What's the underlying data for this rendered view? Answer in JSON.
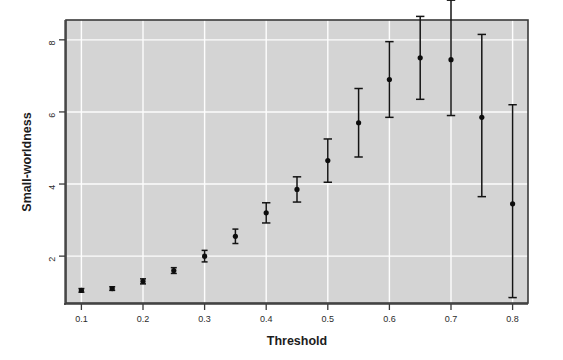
{
  "chart_data": {
    "type": "scatter",
    "title": "",
    "xlabel": "Threshold",
    "ylabel": "Small-worldness",
    "x": [
      0.1,
      0.15,
      0.2,
      0.25,
      0.3,
      0.35,
      0.4,
      0.45,
      0.5,
      0.55,
      0.6,
      0.65,
      0.7,
      0.75,
      0.8
    ],
    "values": [
      1.05,
      1.1,
      1.3,
      1.6,
      2.0,
      2.55,
      3.2,
      3.85,
      4.65,
      5.7,
      6.9,
      7.5,
      7.45,
      5.85,
      3.45
    ],
    "error_low": [
      0.05,
      0.05,
      0.07,
      0.08,
      0.16,
      0.2,
      0.28,
      0.35,
      0.6,
      0.95,
      1.05,
      1.15,
      1.55,
      2.2,
      2.6
    ],
    "error_high": [
      0.05,
      0.05,
      0.07,
      0.08,
      0.16,
      0.2,
      0.28,
      0.35,
      0.6,
      0.95,
      1.05,
      1.15,
      1.65,
      2.3,
      2.75
    ],
    "error_type": "symmetric-bars",
    "xlim": [
      0.075,
      0.825
    ],
    "ylim": [
      0.7,
      8.55
    ],
    "xticks": [
      0.1,
      0.2,
      0.3,
      0.4,
      0.5,
      0.6,
      0.7,
      0.8
    ],
    "xticklabels": [
      "0.1",
      "0.2",
      "0.3",
      "0.4",
      "0.5",
      "0.6",
      "0.7",
      "0.8"
    ],
    "yticks": [
      2,
      4,
      6,
      8
    ],
    "yticklabels": [
      "2",
      "4",
      "6",
      "8"
    ],
    "grid": true,
    "grid_color": "#ffffff",
    "panel_background": "#d4d4d4",
    "point_color": "#0d0d0d",
    "legend": null,
    "legend_position": "none"
  },
  "axes": {
    "x_title": "Threshold",
    "y_title": "Small-worldness"
  },
  "ticks": {
    "x": [
      "0.1",
      "0.2",
      "0.3",
      "0.4",
      "0.5",
      "0.6",
      "0.7",
      "0.8"
    ],
    "y": [
      "8",
      "6",
      "4",
      "2"
    ]
  }
}
